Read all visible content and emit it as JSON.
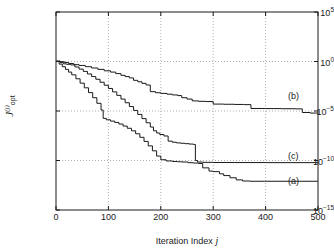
{
  "chart_data": {
    "type": "line",
    "title": "",
    "xlabel": "Iteration Index j",
    "ylabel": "J_opt^(j)",
    "xlim": [
      0,
      500
    ],
    "ylim": [
      1e-15,
      100000.0
    ],
    "yscale": "log",
    "xticks": [
      0,
      100,
      200,
      300,
      400,
      500
    ],
    "xticklabels": [
      "0",
      "100",
      "200",
      "300",
      "400",
      "500"
    ],
    "yticks": [
      100000.0,
      1,
      1e-05,
      1e-10,
      1e-15
    ],
    "yticklabels": [
      "10^5",
      "10^0",
      "10^-5",
      "10^-10",
      "10^-15"
    ],
    "grid": true,
    "grid_style": "dotted",
    "legend_position": "inline-right",
    "series": [
      {
        "name": "(a)",
        "label": "(a)",
        "color": "#1a1a1a",
        "final_value": 8e-13,
        "points": [
          [
            0,
            1.0
          ],
          [
            6,
            0.55
          ],
          [
            12,
            0.3
          ],
          [
            18,
            0.16
          ],
          [
            24,
            0.085
          ],
          [
            30,
            0.045
          ],
          [
            38,
            0.018
          ],
          [
            46,
            0.0065
          ],
          [
            54,
            0.0022
          ],
          [
            62,
            0.00072
          ],
          [
            70,
            0.00022
          ],
          [
            78,
            6e-05
          ],
          [
            86,
            1.25e-05
          ],
          [
            90,
            1.8e-06
          ],
          [
            96,
            1.3e-06
          ],
          [
            104,
            9.5e-07
          ],
          [
            112,
            7e-07
          ],
          [
            120,
            4.8e-07
          ],
          [
            128,
            3e-07
          ],
          [
            136,
            1.8e-07
          ],
          [
            144,
            1e-07
          ],
          [
            152,
            5e-08
          ],
          [
            160,
            2.2e-08
          ],
          [
            168,
            8.5e-09
          ],
          [
            176,
            3e-09
          ],
          [
            184,
            9.5e-10
          ],
          [
            192,
            2.8e-10
          ],
          [
            200,
            1.2e-10
          ],
          [
            210,
            9e-11
          ],
          [
            222,
            8e-11
          ],
          [
            232,
            7.5e-11
          ],
          [
            240,
            7e-11
          ],
          [
            252,
            6e-11
          ],
          [
            262,
            5.5e-11
          ],
          [
            272,
            5e-11
          ],
          [
            280,
            1.8e-11
          ],
          [
            292,
            8.5e-12
          ],
          [
            300,
            7.5e-12
          ],
          [
            312,
            4.5e-12
          ],
          [
            320,
            3e-12
          ],
          [
            332,
            1.8e-12
          ],
          [
            344,
            1.1e-12
          ],
          [
            356,
            8.5e-13
          ],
          [
            370,
            8e-13
          ],
          [
            400,
            8e-13
          ],
          [
            500,
            8e-13
          ]
        ]
      },
      {
        "name": "(b)",
        "label": "(b)",
        "color": "#1a1a1a",
        "final_value": 6e-06,
        "points": [
          [
            0,
            1.1
          ],
          [
            8,
            0.95
          ],
          [
            16,
            0.8
          ],
          [
            24,
            0.62
          ],
          [
            34,
            0.48
          ],
          [
            44,
            0.4
          ],
          [
            56,
            0.3
          ],
          [
            68,
            0.22
          ],
          [
            80,
            0.16
          ],
          [
            92,
            0.115
          ],
          [
            104,
            0.085
          ],
          [
            114,
            0.06
          ],
          [
            124,
            0.04
          ],
          [
            132,
            0.03
          ],
          [
            140,
            0.022
          ],
          [
            148,
            0.0125
          ],
          [
            156,
            0.009
          ],
          [
            164,
            0.0062
          ],
          [
            172,
            0.0042
          ],
          [
            180,
            0.0009
          ],
          [
            190,
            0.0007
          ],
          [
            200,
            0.0006
          ],
          [
            212,
            0.0005
          ],
          [
            222,
            0.00042
          ],
          [
            232,
            0.00036
          ],
          [
            240,
            0.00022
          ],
          [
            250,
            0.00016
          ],
          [
            260,
            0.000105
          ],
          [
            272,
            9.5e-05
          ],
          [
            286,
            9e-05
          ],
          [
            300,
            5e-05
          ],
          [
            320,
            4.8e-05
          ],
          [
            340,
            4.6e-05
          ],
          [
            358,
            4.4e-05
          ],
          [
            372,
            1.8e-05
          ],
          [
            400,
            1.75e-05
          ],
          [
            430,
            1.7e-05
          ],
          [
            456,
            1.65e-05
          ],
          [
            470,
            7e-06
          ],
          [
            485,
            6.2e-06
          ],
          [
            500,
            6e-06
          ]
        ]
      },
      {
        "name": "(c)",
        "label": "(c)",
        "color": "#1a1a1a",
        "final_value": 6e-11,
        "points": [
          [
            0,
            1.05
          ],
          [
            8,
            0.8
          ],
          [
            14,
            0.58
          ],
          [
            20,
            0.52
          ],
          [
            28,
            0.45
          ],
          [
            36,
            0.28
          ],
          [
            44,
            0.17
          ],
          [
            52,
            0.1
          ],
          [
            60,
            0.055
          ],
          [
            68,
            0.03
          ],
          [
            76,
            0.016
          ],
          [
            84,
            0.008
          ],
          [
            92,
            0.004
          ],
          [
            100,
            0.0019
          ],
          [
            108,
            0.00085
          ],
          [
            116,
            0.00038
          ],
          [
            124,
            0.00016
          ],
          [
            132,
            6.8e-05
          ],
          [
            140,
            2.8e-05
          ],
          [
            148,
            1.15e-05
          ],
          [
            156,
            4.5e-06
          ],
          [
            164,
            1.7e-06
          ],
          [
            172,
            6.5e-07
          ],
          [
            180,
            2.4e-07
          ],
          [
            186,
            1e-07
          ],
          [
            192,
            6e-08
          ],
          [
            198,
            4.2e-08
          ],
          [
            206,
            3e-08
          ],
          [
            214,
            9e-09
          ],
          [
            222,
            7e-09
          ],
          [
            230,
            6e-09
          ],
          [
            238,
            5.5e-09
          ],
          [
            246,
            5e-09
          ],
          [
            254,
            4.6e-09
          ],
          [
            262,
            4.2e-09
          ],
          [
            266,
            1e-10
          ],
          [
            270,
            7e-11
          ],
          [
            280,
            6.5e-11
          ],
          [
            300,
            6.3e-11
          ],
          [
            340,
            6.2e-11
          ],
          [
            400,
            6.1e-11
          ],
          [
            500,
            6e-11
          ]
        ]
      }
    ],
    "annotations": [
      {
        "text": "(b)",
        "x": 455,
        "y_px": 97
      },
      {
        "text": "(c)",
        "x": 455,
        "y_px": 157
      },
      {
        "text": "(a)",
        "x": 455,
        "y_px": 182
      }
    ]
  },
  "axes": {
    "x_title": "Iteration Index",
    "x_symbol": "j",
    "y_base": "J",
    "y_sub": "opt",
    "y_sup": "(j)"
  }
}
